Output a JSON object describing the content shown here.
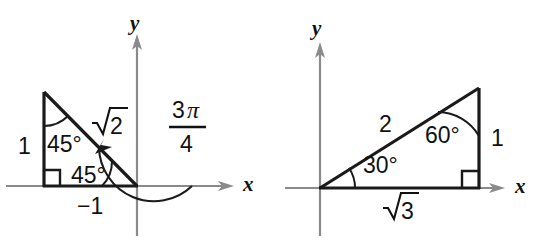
{
  "figure": {
    "panels": [
      {
        "id": "left",
        "name": "135-degree reference triangle",
        "axis_x_label": "x",
        "axis_y_label": "y",
        "angle_top_label": "45°",
        "angle_bottom_label": "45°",
        "hypotenuse_label_radicand": "2",
        "hypotenuse_label": "√2",
        "vertical_leg_label": "1",
        "horizontal_leg_label": "−1",
        "rotation_numerator_coefficient": "3",
        "rotation_numerator_symbol": "π",
        "rotation_denominator": "4",
        "rotation_label": "3π/4",
        "right_angle_marker": "right-angle-square"
      },
      {
        "id": "right",
        "name": "30-60-90 reference triangle",
        "axis_x_label": "x",
        "axis_y_label": "y",
        "angle_at_origin_label": "30°",
        "angle_at_apex_label": "60°",
        "hypotenuse_label": "2",
        "vertical_leg_label": "1",
        "horizontal_leg_label_radicand": "3",
        "horizontal_leg_label": "√3",
        "right_angle_marker": "right-angle-square"
      }
    ]
  },
  "colors": {
    "background": "#ffffff",
    "axis": "#8a8a8a",
    "shape": "#1a1a1a",
    "text": "#111111"
  }
}
